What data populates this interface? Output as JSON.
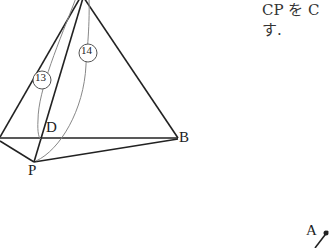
{
  "figure1": {
    "vertex_labels": {
      "D": "D",
      "B": "B",
      "P": "P"
    },
    "path_labels": {
      "p13": "13",
      "p14": "14"
    }
  },
  "text": {
    "line1": "CP を C",
    "line2": "す."
  },
  "figure2": {
    "vertex_labels": {
      "A": "A"
    }
  }
}
